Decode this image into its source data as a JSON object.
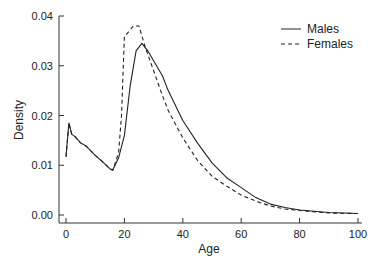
{
  "chart_data": {
    "type": "line",
    "title": "",
    "xlabel": "Age",
    "ylabel": "Density",
    "xlim": [
      0,
      100
    ],
    "ylim": [
      0.0,
      0.04
    ],
    "xticks": [
      0,
      20,
      40,
      60,
      80,
      100
    ],
    "xtick_labels": [
      "0",
      "20",
      "40",
      "60",
      "80",
      "100"
    ],
    "yticks": [
      0.0,
      0.01,
      0.02,
      0.03,
      0.04
    ],
    "ytick_labels": [
      "0.00",
      "0.01",
      "0.02",
      "0.03",
      "0.04"
    ],
    "grid": false,
    "legend_position": "upper right",
    "series": [
      {
        "name": "Males",
        "style": "solid",
        "color": "#222222",
        "x": [
          0,
          1,
          2,
          3,
          5,
          7,
          10,
          12,
          15,
          16,
          18,
          20,
          22,
          24,
          26,
          28,
          30,
          33,
          35,
          40,
          45,
          50,
          55,
          60,
          65,
          70,
          75,
          80,
          90,
          100
        ],
        "values": [
          0.0117,
          0.0185,
          0.0162,
          0.0158,
          0.0145,
          0.0138,
          0.012,
          0.011,
          0.0093,
          0.009,
          0.0115,
          0.016,
          0.026,
          0.033,
          0.0345,
          0.033,
          0.031,
          0.028,
          0.025,
          0.019,
          0.0145,
          0.0105,
          0.0075,
          0.0055,
          0.0035,
          0.0022,
          0.0015,
          0.001,
          0.0005,
          0.0003
        ]
      },
      {
        "name": "Females",
        "style": "dashed",
        "color": "#222222",
        "x": [
          0,
          1,
          2,
          3,
          5,
          7,
          10,
          12,
          15,
          16,
          18,
          19,
          20,
          21,
          23,
          25,
          26,
          27,
          30,
          33,
          35,
          40,
          45,
          50,
          55,
          60,
          65,
          70,
          75,
          80,
          90,
          100
        ],
        "values": [
          0.0117,
          0.0185,
          0.0162,
          0.0158,
          0.0145,
          0.0138,
          0.012,
          0.011,
          0.0093,
          0.009,
          0.0125,
          0.02,
          0.036,
          0.0365,
          0.038,
          0.038,
          0.036,
          0.034,
          0.029,
          0.024,
          0.021,
          0.0155,
          0.011,
          0.0078,
          0.0058,
          0.004,
          0.0028,
          0.0018,
          0.0012,
          0.0009,
          0.0004,
          0.0003
        ]
      }
    ]
  },
  "legend": {
    "items": [
      {
        "label": "Males",
        "style": "solid"
      },
      {
        "label": "Females",
        "style": "dashed"
      }
    ]
  }
}
